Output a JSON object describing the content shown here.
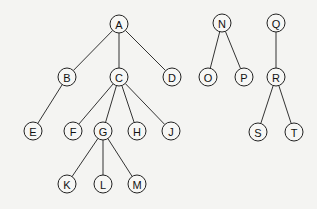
{
  "diagram": {
    "type": "forest",
    "node_radius": 9,
    "nodes": [
      {
        "id": "A",
        "label": "A",
        "x": 119,
        "y": 24
      },
      {
        "id": "B",
        "label": "B",
        "x": 67,
        "y": 77
      },
      {
        "id": "C",
        "label": "C",
        "x": 119,
        "y": 77
      },
      {
        "id": "D",
        "label": "D",
        "x": 172,
        "y": 77
      },
      {
        "id": "E",
        "label": "E",
        "x": 33,
        "y": 131
      },
      {
        "id": "F",
        "label": "F",
        "x": 73,
        "y": 131
      },
      {
        "id": "G",
        "label": "G",
        "x": 103,
        "y": 131
      },
      {
        "id": "H",
        "label": "H",
        "x": 137,
        "y": 131
      },
      {
        "id": "J",
        "label": "J",
        "x": 171,
        "y": 131
      },
      {
        "id": "K",
        "label": "K",
        "x": 67,
        "y": 184
      },
      {
        "id": "L",
        "label": "L",
        "x": 103,
        "y": 184
      },
      {
        "id": "M",
        "label": "M",
        "x": 137,
        "y": 184
      },
      {
        "id": "N",
        "label": "N",
        "x": 222,
        "y": 23
      },
      {
        "id": "O",
        "label": "O",
        "x": 208,
        "y": 77
      },
      {
        "id": "P",
        "label": "P",
        "x": 244,
        "y": 77
      },
      {
        "id": "Q",
        "label": "Q",
        "x": 276,
        "y": 23
      },
      {
        "id": "R",
        "label": "R",
        "x": 276,
        "y": 77
      },
      {
        "id": "S",
        "label": "S",
        "x": 258,
        "y": 132
      },
      {
        "id": "T",
        "label": "T",
        "x": 294,
        "y": 132
      }
    ],
    "edges": [
      [
        "A",
        "B"
      ],
      [
        "A",
        "C"
      ],
      [
        "A",
        "D"
      ],
      [
        "B",
        "E"
      ],
      [
        "C",
        "F"
      ],
      [
        "C",
        "G"
      ],
      [
        "C",
        "H"
      ],
      [
        "C",
        "J"
      ],
      [
        "G",
        "K"
      ],
      [
        "G",
        "L"
      ],
      [
        "G",
        "M"
      ],
      [
        "N",
        "O"
      ],
      [
        "N",
        "P"
      ],
      [
        "Q",
        "R"
      ],
      [
        "R",
        "S"
      ],
      [
        "R",
        "T"
      ]
    ]
  }
}
